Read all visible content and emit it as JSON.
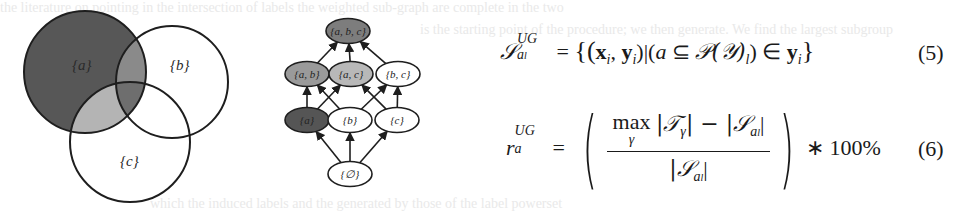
{
  "venn": {
    "sets": [
      {
        "label": "{a}",
        "cx": 85,
        "cy": 72,
        "r": 61,
        "fill": "#575757"
      },
      {
        "label": "{b}",
        "cx": 172,
        "cy": 82,
        "r": 56,
        "fill": "#ffffff"
      },
      {
        "label": "{c}",
        "cx": 130,
        "cy": 142,
        "r": 60,
        "fill": "#ffffff"
      }
    ],
    "intersections": {
      "a_b": "#8a8a8a",
      "a_c": "#b4b4b4",
      "a_b_c": "#6e6e6e"
    },
    "labels": {
      "a": "{a}",
      "b": "{b}",
      "c": "{c}"
    }
  },
  "lattice": {
    "nodes": [
      {
        "id": "abc",
        "label": "{a, b, c}",
        "x": 348,
        "y": 31,
        "fill": "#7d7d7d"
      },
      {
        "id": "ab",
        "label": "{a, b}",
        "x": 307,
        "y": 74,
        "fill": "#9a9a9a"
      },
      {
        "id": "ac",
        "label": "{a, c}",
        "x": 351,
        "y": 74,
        "fill": "#b8b8b8"
      },
      {
        "id": "bc",
        "label": "{b, c}",
        "x": 398,
        "y": 74,
        "fill": "#ffffff"
      },
      {
        "id": "a",
        "label": "{a}",
        "x": 307,
        "y": 120,
        "fill": "#555555"
      },
      {
        "id": "b",
        "label": "{b}",
        "x": 350,
        "y": 120,
        "fill": "#ffffff"
      },
      {
        "id": "c",
        "label": "{c}",
        "x": 397,
        "y": 120,
        "fill": "#ffffff"
      },
      {
        "id": "empty",
        "label": "{∅}",
        "x": 350,
        "y": 174,
        "fill": "#ffffff"
      }
    ],
    "edges": [
      [
        "ab",
        "abc"
      ],
      [
        "ac",
        "abc"
      ],
      [
        "bc",
        "abc"
      ],
      [
        "a",
        "ab"
      ],
      [
        "a",
        "ac"
      ],
      [
        "b",
        "ab"
      ],
      [
        "b",
        "bc"
      ],
      [
        "c",
        "ac"
      ],
      [
        "c",
        "bc"
      ],
      [
        "empty",
        "a"
      ],
      [
        "empty",
        "b"
      ],
      [
        "empty",
        "c"
      ]
    ]
  },
  "equations": {
    "eq5": {
      "lhs_symbol": "𝒮",
      "lhs_sup": "UG",
      "lhs_sub_base": "a",
      "lhs_sub_sub": "l",
      "equals": "=",
      "rhs_open": "{(",
      "x": "x",
      "i1": "i",
      "comma": ", ",
      "y": "y",
      "i2": "i",
      "mid": ")|(",
      "a": "a",
      "subseteq": " ⊆ ",
      "P": "𝒫",
      "Y": "(𝒴)",
      "l": "l",
      "close_in": ") ∈ ",
      "y2": "y",
      "i3": "i",
      "rhs_close": "}",
      "number": "(5)"
    },
    "eq6": {
      "lhs": "r",
      "lhs_sup": "UG",
      "lhs_sub": "a",
      "equals": "=",
      "max": "max",
      "max_sub": "γ",
      "num_T": "|𝒯",
      "num_T_sub": "γ",
      "num_mid": "| − |𝒮",
      "num_S_sub": "a",
      "num_S_subsub": "l",
      "num_end": "|",
      "den_S": "|𝒮",
      "den_S_sub": "a",
      "den_S_subsub": "l",
      "den_end": "|",
      "paren_open": "(",
      "paren_close": ")",
      "times": "∗ 100%",
      "number": "(6)"
    }
  },
  "background_bleed": {
    "line1": "the literature on pointing in the intersection of labels the weighted sub-graph are complete in the two",
    "line2": "is the starting point of the procedure; we then generate. We find the largest subgroup",
    "line3": "which the induced labels and the generated by those of the label powerset"
  }
}
